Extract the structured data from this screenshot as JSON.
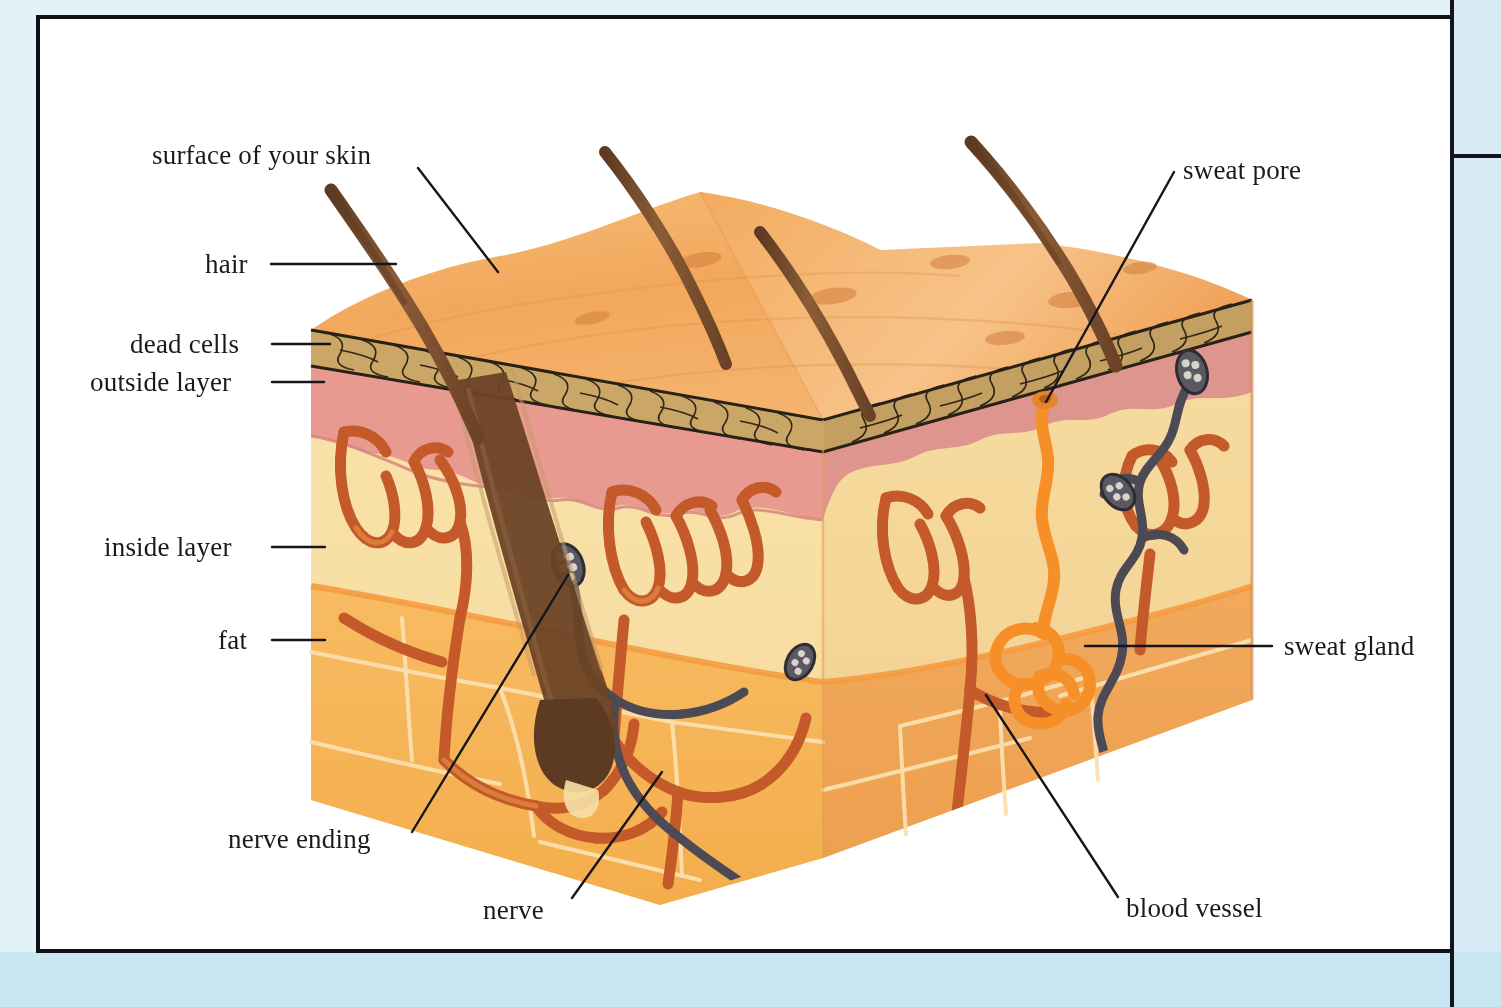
{
  "page": {
    "kind": "textbook-illustration",
    "frame_color": "#dceef7",
    "sheet_color": "#ffffff",
    "rule_color": "#14141c"
  },
  "palette": {
    "skin_surface": "#f3ad63",
    "skin_surface_light": "#f8c78d",
    "dead_cells": "#c8a261",
    "dead_cells_line": "#2b2216",
    "outside_layer_pink": "#e89a90",
    "outside_layer_pink_dark": "#c98b86",
    "inside_layer_cream": "#f7dfa5",
    "fat_orange": "#f6b455",
    "right_face_orange": "#efa85e",
    "blood_vessel": "#c4592a",
    "blood_vessel_light": "#d9752f",
    "sweat_duct": "#f78f28",
    "nerve_gray": "#4b4a55",
    "hair_brown": "#7d5233",
    "hair_brown_dark": "#5d3a23",
    "leader_line": "#15151c"
  },
  "labels": [
    {
      "id": "surface-of-your-skin",
      "text": "surface of your skin",
      "x": 152,
      "y": 142,
      "align": "left",
      "leader": [
        [
          418,
          168
        ],
        [
          498,
          272
        ]
      ]
    },
    {
      "id": "hair",
      "text": "hair",
      "x": 205,
      "y": 251,
      "align": "left",
      "leader": [
        [
          271,
          264
        ],
        [
          396,
          264
        ]
      ]
    },
    {
      "id": "dead-cells",
      "text": "dead cells",
      "x": 130,
      "y": 331,
      "align": "left",
      "leader": [
        [
          272,
          344
        ],
        [
          330,
          344
        ]
      ]
    },
    {
      "id": "outside-layer",
      "text": "outside layer",
      "x": 90,
      "y": 369,
      "align": "left",
      "leader": [
        [
          272,
          382
        ],
        [
          324,
          382
        ]
      ]
    },
    {
      "id": "inside-layer",
      "text": "inside layer",
      "x": 104,
      "y": 534,
      "align": "left",
      "leader": [
        [
          272,
          547
        ],
        [
          325,
          547
        ]
      ]
    },
    {
      "id": "fat",
      "text": "fat",
      "x": 218,
      "y": 627,
      "align": "left",
      "leader": [
        [
          272,
          640
        ],
        [
          325,
          640
        ]
      ]
    },
    {
      "id": "nerve-ending",
      "text": "nerve ending",
      "x": 228,
      "y": 826,
      "align": "left",
      "leader": [
        [
          412,
          832
        ],
        [
          568,
          575
        ]
      ]
    },
    {
      "id": "nerve",
      "text": "nerve",
      "x": 483,
      "y": 897,
      "align": "left",
      "leader": [
        [
          572,
          898
        ],
        [
          662,
          772
        ]
      ]
    },
    {
      "id": "sweat-pore",
      "text": "sweat pore",
      "x": 1183,
      "y": 157,
      "align": "left",
      "leader": [
        [
          1174,
          172
        ],
        [
          1046,
          402
        ]
      ]
    },
    {
      "id": "sweat-gland",
      "text": "sweat gland",
      "x": 1284,
      "y": 633,
      "align": "left",
      "leader": [
        [
          1272,
          646
        ],
        [
          1085,
          646
        ]
      ]
    },
    {
      "id": "blood-vessel",
      "text": "blood vessel",
      "x": 1126,
      "y": 895,
      "align": "left",
      "leader": [
        [
          1118,
          897
        ],
        [
          986,
          695
        ]
      ]
    }
  ],
  "structures": [
    {
      "id": "hair-shaft",
      "name": "hair",
      "count": 4
    },
    {
      "id": "hair-follicle",
      "name": "hair follicle with bulb"
    },
    {
      "id": "dead-cell-layer",
      "name": "dead cells (stratum corneum)"
    },
    {
      "id": "outside-layer",
      "name": "outside layer (epidermis)"
    },
    {
      "id": "inside-layer",
      "name": "inside layer (dermis)"
    },
    {
      "id": "fat-layer",
      "name": "fat (subcutaneous tissue)"
    },
    {
      "id": "blood-vessels",
      "name": "blood vessel network"
    },
    {
      "id": "sweat-gland",
      "name": "sweat gland and duct"
    },
    {
      "id": "sweat-pore",
      "name": "sweat pore"
    },
    {
      "id": "nerves",
      "name": "nerve fibres"
    },
    {
      "id": "nerve-endings",
      "name": "nerve endings",
      "count": 4
    }
  ]
}
